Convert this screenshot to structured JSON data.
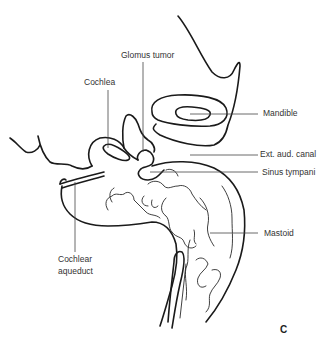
{
  "figure": {
    "panel_letter": "C",
    "labels": {
      "glomus_tumor": "Glomus tumor",
      "cochlea": "Cochlea",
      "mandible": "Mandible",
      "ext_aud_canal": "Ext. aud. canal",
      "sinus_tympani": "Sinus tympani",
      "mastoid": "Mastoid",
      "cochlear_aqueduct_line1": "Cochlear",
      "cochlear_aqueduct_line2": "aqueduct"
    }
  }
}
